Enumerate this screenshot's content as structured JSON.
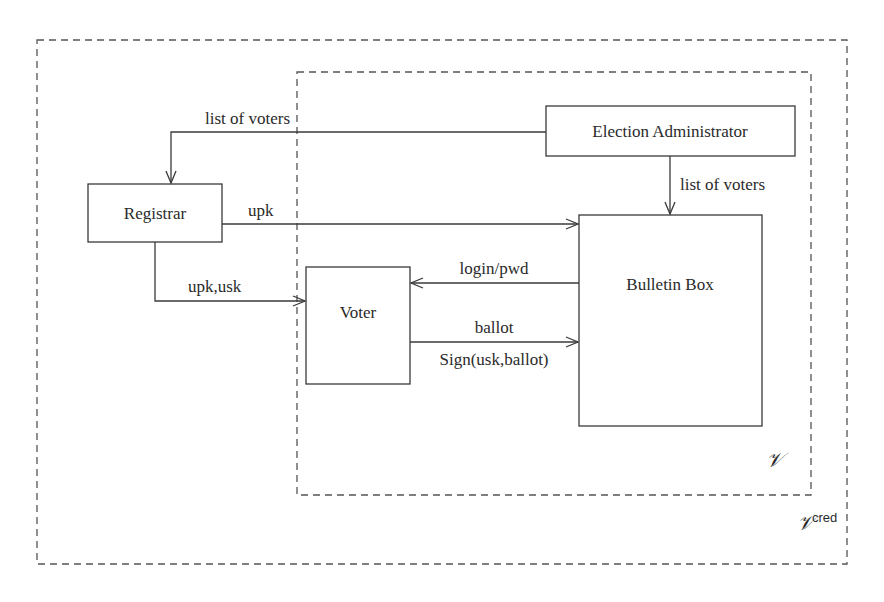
{
  "diagram": {
    "regions": {
      "outer": {
        "label": "𝒱",
        "superscript": "cred"
      },
      "inner": {
        "label": "𝒱"
      }
    },
    "nodes": {
      "registrar": {
        "label": "Registrar"
      },
      "election_admin": {
        "label": "Election Administrator"
      },
      "voter": {
        "label": "Voter"
      },
      "bulletin_box": {
        "label": "Bulletin Box"
      }
    },
    "edges": {
      "admin_to_registrar": {
        "label": "list of voters",
        "from": "Election Administrator",
        "to": "Registrar"
      },
      "admin_to_bulletin": {
        "label": "list of voters",
        "from": "Election Administrator",
        "to": "Bulletin Box"
      },
      "registrar_to_bulletin": {
        "label": "upk",
        "from": "Registrar",
        "to": "Bulletin Box"
      },
      "registrar_to_voter": {
        "label": "upk,usk",
        "from": "Registrar",
        "to": "Voter"
      },
      "bulletin_to_voter": {
        "label": "login/pwd",
        "from": "Bulletin Box",
        "to": "Voter"
      },
      "voter_to_bulletin_ballot": {
        "label": "ballot",
        "from": "Voter",
        "to": "Bulletin Box"
      },
      "voter_to_bulletin_sign": {
        "label": "Sign(usk,ballot)",
        "from": "Voter",
        "to": "Bulletin Box"
      }
    }
  }
}
